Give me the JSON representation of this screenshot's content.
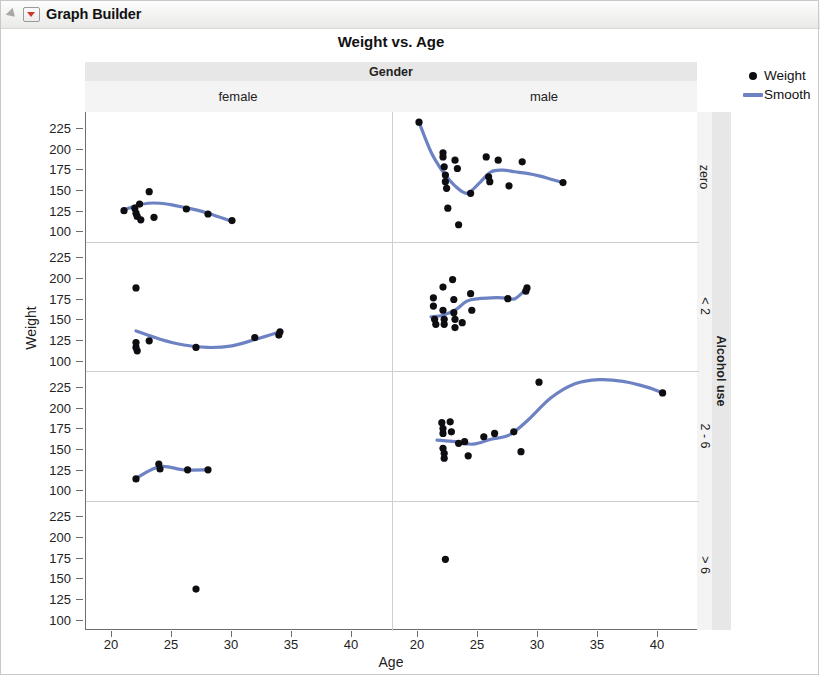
{
  "window": {
    "title": "Graph Builder",
    "disclosure_icon": "triangle-disclosure-icon",
    "red_triangle_icon": "red-triangle-menu-icon"
  },
  "legend": {
    "items": [
      {
        "label": "Weight",
        "marker": "point-marker",
        "color": "#0d0d12"
      },
      {
        "label": "Smooth",
        "marker": "line-marker",
        "color": "#6d82c3"
      }
    ]
  },
  "chart_data": {
    "type": "scatter",
    "title": "Weight vs. Age",
    "xlabel": "Age",
    "ylabel": "Weight",
    "xlim": [
      18.5,
      42.5
    ],
    "ylim": [
      95,
      237
    ],
    "xticks": [
      20,
      25,
      30,
      35,
      40
    ],
    "yticks": [
      100,
      125,
      150,
      175,
      200,
      225
    ],
    "grid": false,
    "legend_position": "right",
    "facet": {
      "column_variable": "Gender",
      "column_levels": [
        "female",
        "male"
      ],
      "row_variable": "Alcohol use",
      "row_levels": [
        "zero",
        "< 2",
        "2 - 6",
        "> 6"
      ]
    },
    "series_names": [
      "Weight",
      "Smooth"
    ],
    "panels": [
      {
        "row": "zero",
        "col": "female",
        "points": [
          [
            21.0,
            125
          ],
          [
            21.9,
            128
          ],
          [
            22.0,
            122
          ],
          [
            22.1,
            118
          ],
          [
            22.3,
            133
          ],
          [
            22.4,
            114
          ],
          [
            23.1,
            148
          ],
          [
            23.5,
            117
          ],
          [
            26.2,
            127
          ],
          [
            28.0,
            121
          ],
          [
            30.0,
            113
          ]
        ],
        "smooth": [
          [
            21.0,
            126
          ],
          [
            22.0,
            131
          ],
          [
            23.0,
            134
          ],
          [
            24.0,
            134
          ],
          [
            25.0,
            132
          ],
          [
            26.0,
            129
          ],
          [
            27.0,
            126
          ],
          [
            28.0,
            122
          ],
          [
            29.0,
            117
          ],
          [
            30.0,
            112
          ]
        ]
      },
      {
        "row": "zero",
        "col": "male",
        "points": [
          [
            20.0,
            232
          ],
          [
            22.0,
            195
          ],
          [
            22.0,
            190
          ],
          [
            22.1,
            178
          ],
          [
            22.2,
            168
          ],
          [
            22.2,
            160
          ],
          [
            22.3,
            152
          ],
          [
            22.4,
            128
          ],
          [
            23.0,
            186
          ],
          [
            23.2,
            176
          ],
          [
            23.3,
            108
          ],
          [
            24.3,
            146
          ],
          [
            25.6,
            190
          ],
          [
            25.8,
            166
          ],
          [
            25.9,
            160
          ],
          [
            26.6,
            186
          ],
          [
            27.5,
            155
          ],
          [
            28.6,
            184
          ],
          [
            32.0,
            159
          ]
        ],
        "smooth": [
          [
            20.0,
            232
          ],
          [
            21.0,
            196
          ],
          [
            22.0,
            172
          ],
          [
            23.0,
            155
          ],
          [
            24.0,
            146
          ],
          [
            25.0,
            158
          ],
          [
            26.0,
            172
          ],
          [
            27.0,
            174
          ],
          [
            28.0,
            172
          ],
          [
            29.0,
            170
          ],
          [
            30.0,
            167
          ],
          [
            31.0,
            163
          ],
          [
            32.0,
            159
          ]
        ]
      },
      {
        "row": "< 2",
        "col": "female",
        "points": [
          [
            22.0,
            190
          ],
          [
            22.0,
            124
          ],
          [
            22.0,
            118
          ],
          [
            22.1,
            114
          ],
          [
            23.1,
            126
          ],
          [
            27.0,
            118
          ],
          [
            31.9,
            130
          ],
          [
            34.0,
            137
          ],
          [
            33.9,
            133
          ]
        ],
        "smooth": [
          [
            22.0,
            138
          ],
          [
            24.0,
            128
          ],
          [
            26.0,
            121
          ],
          [
            28.0,
            118
          ],
          [
            30.0,
            120
          ],
          [
            32.0,
            128
          ],
          [
            34.0,
            137
          ]
        ]
      },
      {
        "row": "< 2",
        "col": "male",
        "points": [
          [
            21.2,
            178
          ],
          [
            21.2,
            168
          ],
          [
            21.3,
            152
          ],
          [
            21.4,
            146
          ],
          [
            22.0,
            191
          ],
          [
            22.0,
            163
          ],
          [
            22.1,
            152
          ],
          [
            22.1,
            146
          ],
          [
            22.8,
            200
          ],
          [
            22.9,
            176
          ],
          [
            22.9,
            160
          ],
          [
            23.0,
            152
          ],
          [
            23.0,
            142
          ],
          [
            23.6,
            148
          ],
          [
            24.3,
            183
          ],
          [
            24.4,
            163
          ],
          [
            27.4,
            177
          ],
          [
            29.0,
            190
          ],
          [
            28.9,
            186
          ]
        ],
        "smooth": [
          [
            21.0,
            155
          ],
          [
            22.0,
            157
          ],
          [
            23.0,
            163
          ],
          [
            24.0,
            174
          ],
          [
            25.0,
            177
          ],
          [
            26.0,
            178
          ],
          [
            27.0,
            178
          ],
          [
            28.0,
            177
          ],
          [
            29.0,
            190
          ]
        ]
      },
      {
        "row": "2 - 6",
        "col": "female",
        "points": [
          [
            22.0,
            115
          ],
          [
            23.9,
            133
          ],
          [
            24.0,
            127
          ],
          [
            26.3,
            126
          ],
          [
            28.0,
            126
          ]
        ],
        "smooth": [
          [
            22.0,
            116
          ],
          [
            24.0,
            130
          ],
          [
            26.0,
            126
          ],
          [
            28.0,
            126
          ]
        ]
      },
      {
        "row": "2 - 6",
        "col": "male",
        "points": [
          [
            21.9,
            183
          ],
          [
            22.0,
            176
          ],
          [
            22.0,
            170
          ],
          [
            22.0,
            152
          ],
          [
            22.1,
            146
          ],
          [
            22.1,
            140
          ],
          [
            22.6,
            184
          ],
          [
            22.7,
            172
          ],
          [
            23.3,
            158
          ],
          [
            23.8,
            160
          ],
          [
            24.1,
            143
          ],
          [
            25.4,
            166
          ],
          [
            26.3,
            170
          ],
          [
            27.9,
            172
          ],
          [
            28.5,
            148
          ],
          [
            30.0,
            232
          ],
          [
            40.3,
            219
          ]
        ],
        "smooth": [
          [
            21.5,
            162
          ],
          [
            23.0,
            160
          ],
          [
            24.5,
            157
          ],
          [
            26.0,
            163
          ],
          [
            27.5,
            168
          ],
          [
            29.0,
            185
          ],
          [
            31.0,
            213
          ],
          [
            33.0,
            230
          ],
          [
            35.0,
            235
          ],
          [
            37.0,
            233
          ],
          [
            39.0,
            226
          ],
          [
            40.3,
            219
          ]
        ]
      },
      {
        "row": "> 6",
        "col": "female",
        "points": [
          [
            27.0,
            139
          ]
        ],
        "smooth": []
      },
      {
        "row": "> 6",
        "col": "male",
        "points": [
          [
            22.2,
            175
          ]
        ],
        "smooth": []
      }
    ]
  }
}
